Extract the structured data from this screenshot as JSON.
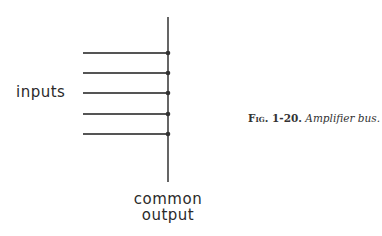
{
  "diagram": {
    "labels": {
      "inputs": "inputs",
      "output_line1": "common",
      "output_line2": "output"
    },
    "bus": {
      "x": 168,
      "y_top": 17,
      "y_bottom": 182
    },
    "input_lines": [
      {
        "y": 53,
        "x_start": 83
      },
      {
        "y": 73,
        "x_start": 83
      },
      {
        "y": 93,
        "x_start": 83
      },
      {
        "y": 114,
        "x_start": 83
      },
      {
        "y": 134,
        "x_start": 83
      }
    ],
    "line_color": "#555555"
  },
  "caption": {
    "figure": "Fig. 1-20.",
    "title": "Amplifier bus."
  }
}
